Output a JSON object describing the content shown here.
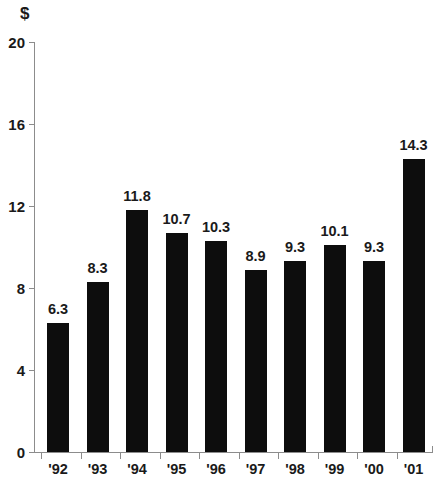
{
  "chart_data": {
    "type": "bar",
    "title": "",
    "subtitle": "",
    "xlabel": "",
    "ylabel": "$",
    "unit_label": "$",
    "categories": [
      "'92",
      "'93",
      "'94",
      "'95",
      "'96",
      "'97",
      "'98",
      "'99",
      "'00",
      "'01"
    ],
    "values": [
      6.3,
      8.3,
      11.8,
      10.7,
      10.3,
      8.9,
      9.3,
      10.1,
      9.3,
      14.3
    ],
    "value_labels": [
      "6.3",
      "8.3",
      "11.8",
      "10.7",
      "10.3",
      "8.9",
      "9.3",
      "10.1",
      "9.3",
      "14.3"
    ],
    "ylim": [
      0,
      20
    ],
    "yticks": [
      0,
      4,
      8,
      12,
      16,
      20
    ],
    "ytick_labels": [
      "0",
      "4",
      "8",
      "12",
      "16",
      "20"
    ],
    "grid": false,
    "legend": null,
    "bar_color": "#0d0d0d",
    "axis_color": "#8c8c8c",
    "text_color": "#1a1a1a",
    "background_color": "#ffffff"
  }
}
